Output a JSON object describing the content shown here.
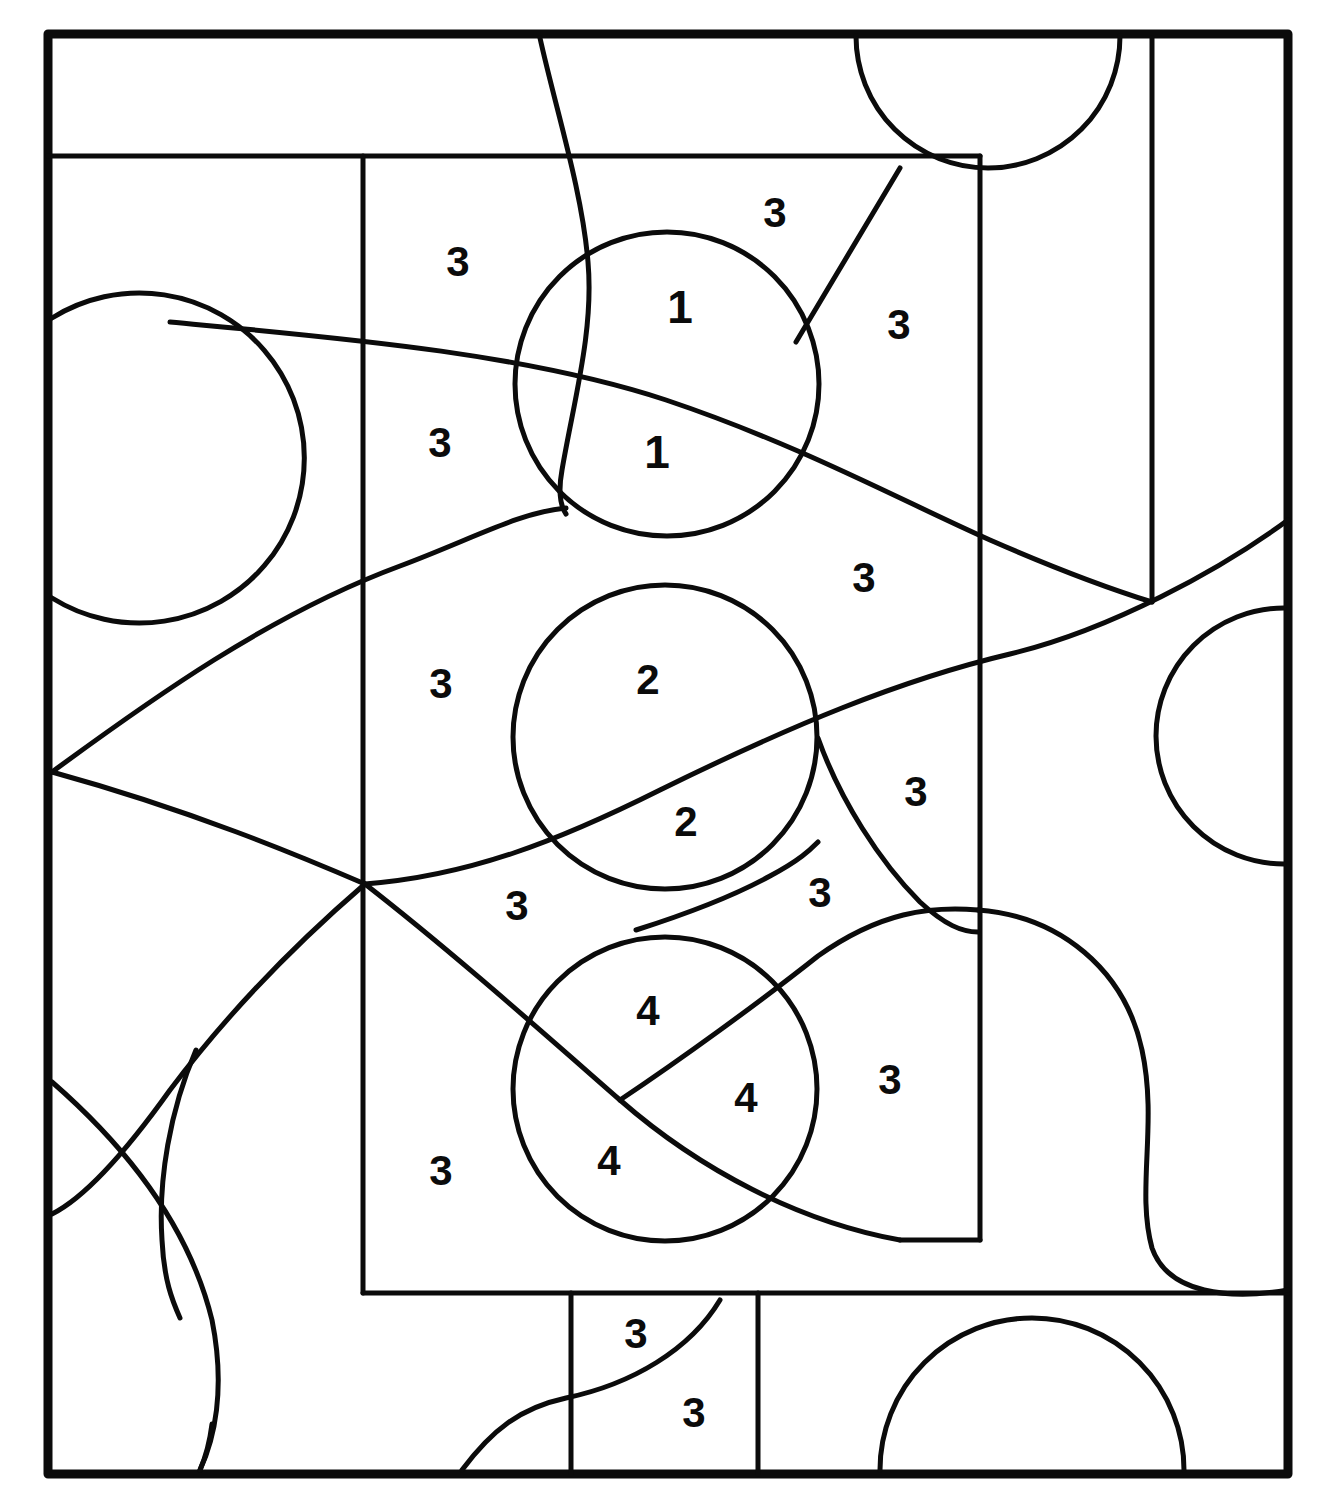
{
  "figure": {
    "background_color": "#ffffff",
    "ink_color": "#0b0b0b",
    "frame": {
      "x": 48,
      "y": 34,
      "width": 1240,
      "height": 1440,
      "stroke_width": 9
    },
    "labels": [
      {
        "id": "l1",
        "text": "3",
        "x": 458,
        "y": 262
      },
      {
        "id": "l2",
        "text": "3",
        "x": 775,
        "y": 213
      },
      {
        "id": "l3",
        "text": "1",
        "x": 680,
        "y": 307
      },
      {
        "id": "l4",
        "text": "3",
        "x": 899,
        "y": 325
      },
      {
        "id": "l5",
        "text": "3",
        "x": 440,
        "y": 443
      },
      {
        "id": "l6",
        "text": "1",
        "x": 657,
        "y": 452
      },
      {
        "id": "l7",
        "text": "3",
        "x": 864,
        "y": 578
      },
      {
        "id": "l8",
        "text": "3",
        "x": 441,
        "y": 684
      },
      {
        "id": "l9",
        "text": "2",
        "x": 648,
        "y": 680
      },
      {
        "id": "l10",
        "text": "2",
        "x": 686,
        "y": 822
      },
      {
        "id": "l11",
        "text": "3",
        "x": 916,
        "y": 792
      },
      {
        "id": "l12",
        "text": "3",
        "x": 517,
        "y": 906
      },
      {
        "id": "l13",
        "text": "3",
        "x": 820,
        "y": 893
      },
      {
        "id": "l14",
        "text": "4",
        "x": 648,
        "y": 1011
      },
      {
        "id": "l15",
        "text": "4",
        "x": 746,
        "y": 1098
      },
      {
        "id": "l16",
        "text": "3",
        "x": 890,
        "y": 1080
      },
      {
        "id": "l17",
        "text": "4",
        "x": 609,
        "y": 1161
      },
      {
        "id": "l18",
        "text": "3",
        "x": 441,
        "y": 1171
      },
      {
        "id": "l19",
        "text": "3",
        "x": 636,
        "y": 1334
      },
      {
        "id": "l20",
        "text": "3",
        "x": 694,
        "y": 1413
      }
    ],
    "label_counts": {
      "1": 2,
      "2": 2,
      "3": 13,
      "4": 3
    },
    "circles": [
      {
        "id": "c-top-left-edge",
        "cx": 110,
        "cy": 455,
        "r": 165
      },
      {
        "id": "c-one",
        "cx": 667,
        "cy": 384,
        "r": 152
      },
      {
        "id": "c-two",
        "cx": 665,
        "cy": 737,
        "r": 152
      },
      {
        "id": "c-four",
        "cx": 665,
        "cy": 1089,
        "r": 152
      },
      {
        "id": "c-top-notch",
        "cx": 975,
        "cy": 40,
        "r": 145
      },
      {
        "id": "c-right-bulge",
        "cx": 1300,
        "cy": 735,
        "r": 130
      },
      {
        "id": "c-bottom-right-arc",
        "cx": 1042,
        "cy": 1474,
        "r": 130
      }
    ]
  }
}
